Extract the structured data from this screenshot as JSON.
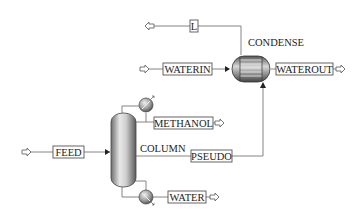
{
  "diagram": {
    "type": "process-flowsheet",
    "blocks": [
      {
        "id": "column",
        "label": "COLUMN",
        "kind": "distillation-column"
      },
      {
        "id": "condense",
        "label": "CONDENSE",
        "kind": "heat-exchanger"
      }
    ],
    "streams": [
      {
        "id": "feed",
        "label": "FEED",
        "from": "external",
        "to": "COLUMN"
      },
      {
        "id": "methanol",
        "label": "METHANOL",
        "from": "COLUMN",
        "to": "external"
      },
      {
        "id": "water",
        "label": "WATER",
        "from": "COLUMN",
        "to": "external"
      },
      {
        "id": "pseudo",
        "label": "PSEUDO",
        "from": "COLUMN",
        "to": "CONDENSE"
      },
      {
        "id": "waterin",
        "label": "WATERIN",
        "from": "external",
        "to": "CONDENSE"
      },
      {
        "id": "waterout",
        "label": "WATEROUT",
        "from": "CONDENSE",
        "to": "external"
      },
      {
        "id": "l",
        "label": "L",
        "from": "CONDENSE",
        "to": "external"
      }
    ]
  },
  "labels": {
    "column": "COLUMN",
    "condense": "CONDENSE",
    "feed": "FEED",
    "methanol": "METHANOL",
    "water": "WATER",
    "pseudo": "PSEUDO",
    "waterin": "WATERIN",
    "waterout": "WATEROUT",
    "l": "L"
  },
  "colors": {
    "line": "#777777",
    "box_border": "#555555",
    "text": "#222222",
    "vessel_dark": "#6e6e6e",
    "vessel_light": "#e8e8e8"
  }
}
